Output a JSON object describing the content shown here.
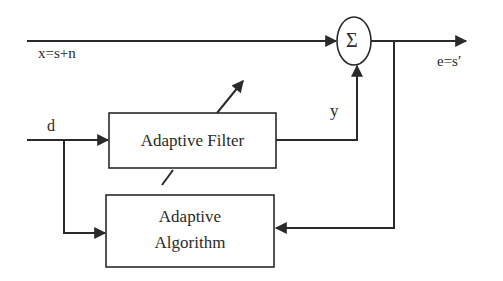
{
  "diagram": {
    "type": "block-diagram",
    "colors": {
      "stroke": "#2a2a2a",
      "background": "#ffffff"
    },
    "blocks": {
      "adaptive_filter": {
        "label": "Adaptive Filter"
      },
      "adaptive_algorithm": {
        "line1": "Adaptive",
        "line2": "Algorithm"
      },
      "summer": {
        "symbol": "Σ"
      }
    },
    "signals": {
      "primary_input": "x=s+n",
      "reference_input": "d",
      "filter_output": "y",
      "error_output": "e=s′"
    },
    "connections": [
      {
        "from": "x=s+n",
        "to": "Σ"
      },
      {
        "from": "d",
        "to": "Adaptive Filter"
      },
      {
        "from": "d",
        "to": "Adaptive Algorithm"
      },
      {
        "from": "Adaptive Filter",
        "to": "Σ",
        "label": "y"
      },
      {
        "from": "Σ",
        "to": "e=s′"
      },
      {
        "from": "e=s′",
        "to": "Adaptive Algorithm",
        "kind": "feedback"
      },
      {
        "from": "Adaptive Algorithm",
        "to": "Adaptive Filter",
        "kind": "weight-adjust"
      }
    ]
  }
}
